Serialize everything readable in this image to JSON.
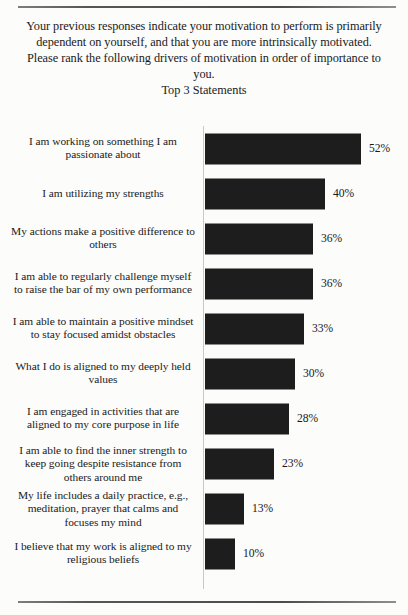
{
  "header": {
    "intro": "Your previous responses indicate your motivation to perform is primarily dependent on yourself, and that you are more intrinsically motivated. Please rank the following drivers of motivation in order of importance to you.",
    "subtitle": "Top 3 Statements"
  },
  "chart_data": {
    "type": "bar",
    "orientation": "horizontal",
    "title": "Top 3 Statements",
    "xlabel": "",
    "ylabel": "",
    "xlim": [
      0,
      60
    ],
    "grid": false,
    "legend": null,
    "value_suffix": "%",
    "categories": [
      "I am working on something I am passionate about",
      "I am utilizing my strengths",
      "My actions make a positive difference to others",
      "I am able to regularly challenge myself to raise the bar of my own performance",
      "I am able to maintain a positive mindset to stay focused amidst obstacles",
      "What I do is aligned to my deeply held values",
      "I am engaged in activities that are aligned to my core purpose in life",
      "I am able to find the inner strength to keep going despite resistance from others around me",
      "My life includes a daily practice, e.g., meditation, prayer that calms and focuses my mind",
      "I believe that my work is aligned to my religious beliefs"
    ],
    "values": [
      52,
      40,
      36,
      36,
      33,
      30,
      28,
      23,
      13,
      10
    ],
    "value_labels": [
      "52%",
      "40%",
      "36%",
      "36%",
      "33%",
      "30%",
      "28%",
      "23%",
      "13%",
      "10%"
    ],
    "bar_color": "#1d1d1d",
    "background_color": "#fcfcfa"
  }
}
